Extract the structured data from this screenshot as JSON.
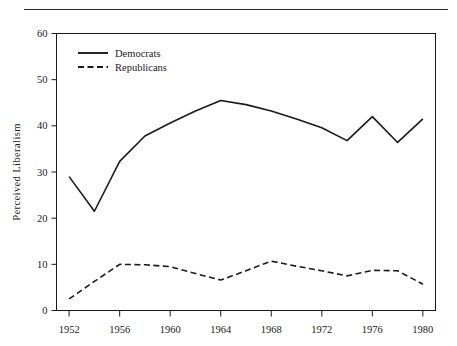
{
  "header": {
    "fragment": ""
  },
  "chart_data": {
    "type": "line",
    "title": "",
    "xlabel": "",
    "ylabel": "Perceived Liberalism",
    "xlim": [
      1951,
      1981
    ],
    "ylim": [
      0,
      60
    ],
    "yticks": [
      0,
      10,
      20,
      30,
      40,
      50,
      60
    ],
    "ytick_labels": [
      "0",
      "10",
      "20",
      "30",
      "40",
      "50",
      "60"
    ],
    "xticks": [
      1952,
      1956,
      1960,
      1964,
      1968,
      1972,
      1976,
      1980
    ],
    "xtick_labels": [
      "1952",
      "1956",
      "1960",
      "1964",
      "1968",
      "1972",
      "1976",
      "1980"
    ],
    "grid": false,
    "legend_position": "top-left",
    "x": [
      1952,
      1954,
      1956,
      1958,
      1960,
      1962,
      1964,
      1966,
      1968,
      1970,
      1972,
      1974,
      1976,
      1978,
      1980
    ],
    "series": [
      {
        "name": "Democrats",
        "style": "solid",
        "color": "#1a1a1a",
        "values": [
          29.0,
          21.5,
          32.3,
          37.8,
          40.6,
          43.2,
          45.5,
          44.6,
          43.2,
          41.5,
          39.6,
          36.8,
          42.0,
          36.4,
          41.5
        ]
      },
      {
        "name": "Republicans",
        "style": "dashed",
        "color": "#1a1a1a",
        "values": [
          2.5,
          6.3,
          10.0,
          9.9,
          9.5,
          8.0,
          6.6,
          8.6,
          10.7,
          9.6,
          8.6,
          7.5,
          8.7,
          8.6,
          5.7
        ]
      }
    ]
  },
  "legend": {
    "items": [
      {
        "label": "Democrats",
        "style": "solid"
      },
      {
        "label": "Republicans",
        "style": "dashed"
      }
    ]
  }
}
